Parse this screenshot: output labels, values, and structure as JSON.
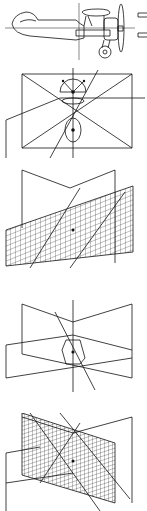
{
  "diagram": {
    "type": "technical line drawings",
    "figures": [
      {
        "id": "fig-biplane",
        "description": "Side view of biplane with crosshair axes and propeller, small mirror marks at right"
      },
      {
        "id": "fig-planes-sphere",
        "description": "Three intersecting orthogonal planes with hemisphere and ellipse marker, diagonal axis line"
      },
      {
        "id": "fig-planes-grid",
        "description": "Intersecting planes with a slanted grid plane and diagonal lines"
      },
      {
        "id": "fig-planes-ellipse",
        "description": "Intersecting planes with central ellipse and diagonal axis"
      },
      {
        "id": "fig-planes-dense-grid",
        "description": "Intersecting planes with dense tilted grid plane"
      }
    ],
    "colors": {
      "line": "#111111",
      "background": "#ffffff"
    }
  }
}
